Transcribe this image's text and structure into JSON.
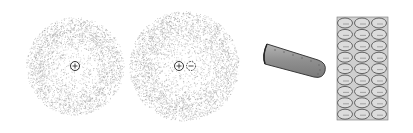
{
  "figure": {
    "background": "#ffffff",
    "panels": [
      {
        "id": "atom-single",
        "description": "Atom with diffuse electron cloud and positive nucleus",
        "center": [
          75,
          66
        ],
        "cloud_radius": 49,
        "nucleus_symbol": "plus-circle-icon"
      },
      {
        "id": "atom-pair",
        "description": "Atom with diffuse electron cloud, positive nucleus and dashed negative particle",
        "center": [
          184,
          66
        ],
        "cloud_radius": 55,
        "nucleus_symbol": "plus-circle-icon",
        "companion_symbol": "minus-dashed-circle-icon"
      },
      {
        "id": "tube",
        "description": "Gray cylindrical rod with rounded end",
        "fill": "#9a9a9a",
        "stroke": "#444444"
      },
      {
        "id": "lattice",
        "description": "Block of ellipses arranged in a grid",
        "columns": 3,
        "rows": 9,
        "fill": "#cfcfcf",
        "ellipse_stroke": "#555555"
      }
    ],
    "colors": {
      "cloud_dot": "#9a9a9a",
      "outline": "#333333"
    }
  }
}
